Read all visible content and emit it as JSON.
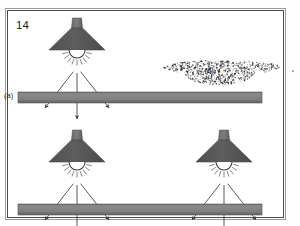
{
  "figure": {
    "number": "14",
    "panel_labels": {
      "a": "(a)",
      "b": "(b)"
    },
    "background_color": "#ffffff",
    "frame_color": "#4a4a4a",
    "page_color": "#fdfdfd"
  },
  "colors": {
    "lamp_shade": "#595959",
    "lamp_shade_dark": "#4a4a4a",
    "lamp_stem": "#6f6f6f",
    "bulb_outline": "#3a3a3a",
    "bar_fill": "#808080",
    "bar_edge": "#585858",
    "arrow": "#3c3c3c",
    "speckle": "#2a2a2a",
    "ray": "#555555"
  },
  "panels": [
    {
      "id": "panel-a",
      "label": "(a)",
      "lamp_count": 1,
      "lamps": [
        {
          "id": "lamp-top",
          "cx": 77,
          "cy": 18,
          "arrows": 3
        }
      ],
      "surface": {
        "id": "surface-top",
        "x": 18,
        "y": 92,
        "width": 244,
        "height": 11
      }
    },
    {
      "id": "panel-b",
      "label": "(b)",
      "cloud": {
        "id": "speckle-cloud",
        "cx": 222,
        "cy": 73,
        "width": 116,
        "height": 26,
        "dot_count": 900
      }
    },
    {
      "id": "panel-c",
      "lamp_count": 2,
      "lamps": [
        {
          "id": "lamp-bottom-left",
          "cx": 77,
          "cy": 130,
          "arrows": 3
        },
        {
          "id": "lamp-bottom-right",
          "cx": 224,
          "cy": 130,
          "arrows": 3
        }
      ],
      "surface": {
        "id": "surface-bottom",
        "x": 18,
        "y": 204,
        "width": 244,
        "height": 11
      }
    }
  ],
  "geometry": {
    "shade_half_width": 28,
    "shade_height": 22,
    "stem_width": 9,
    "stem_height": 10,
    "bulb_radius": 8,
    "ray_count": 9,
    "arrow_length": 52,
    "arrow_spread_deg": 38
  }
}
